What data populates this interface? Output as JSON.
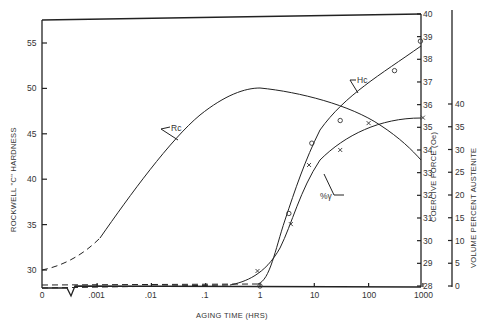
{
  "chart_data": {
    "type": "line",
    "title": "",
    "xlabel": "AGING TIME (HRS)",
    "x_scale": "log (with 0 at origin, broken axis)",
    "x_ticks": [
      "0",
      ".001",
      ".01",
      ".1",
      "1",
      "10",
      "100",
      "1000"
    ],
    "y_axes": [
      {
        "label": "ROCKWELL \"C\" HARDNESS",
        "position": "left",
        "ticks": [
          "30",
          "35",
          "40",
          "45",
          "50",
          "55"
        ],
        "range": [
          28,
          57.5
        ]
      },
      {
        "label": "COERCIVE FORCE (Oe)",
        "position": "right-inner",
        "ticks": [
          "28",
          "29",
          "30",
          "31",
          "32",
          "33",
          "34",
          "35",
          "36",
          "37",
          "38",
          "39",
          "40"
        ],
        "range": [
          28,
          40
        ]
      },
      {
        "label": "VOLUME PERCENT AUSTENITE",
        "position": "right-outer",
        "ticks": [
          "0",
          "5",
          "10",
          "15",
          "20",
          "25",
          "30",
          "35",
          "40"
        ],
        "range": [
          0,
          40
        ]
      }
    ],
    "series": [
      {
        "name": "Rc",
        "axis": "left",
        "x": [
          0,
          0.001,
          0.01,
          0.1,
          1,
          10,
          100,
          1000
        ],
        "values": [
          30,
          33.5,
          43,
          48.3,
          50,
          48.5,
          46,
          42
        ],
        "note": "dashed from 0 to .001"
      },
      {
        "name": "Hc",
        "axis": "coercive",
        "x": [
          0,
          1,
          3,
          10,
          30,
          100,
          300,
          1000
        ],
        "values": [
          28,
          28,
          32,
          35.6,
          36.8,
          37.6,
          38.2,
          38.6
        ],
        "markers": "circle",
        "points": [
          {
            "x": 1,
            "y": 28
          },
          {
            "x": 3.4,
            "y": 31.2
          },
          {
            "x": 9,
            "y": 34.3
          },
          {
            "x": 30,
            "y": 35.3
          },
          {
            "x": 300,
            "y": 37.5
          },
          {
            "x": 900,
            "y": 38.8
          }
        ]
      },
      {
        "name": "%γ",
        "axis": "austenite",
        "x": [
          0,
          0.1,
          1,
          3,
          10,
          30,
          100,
          300,
          1000
        ],
        "values": [
          0,
          0.5,
          3,
          13,
          26,
          32,
          35,
          36,
          37
        ],
        "markers": "cross",
        "points": [
          {
            "x": 0.9,
            "y": 3.3
          },
          {
            "x": 3.7,
            "y": 13.6
          },
          {
            "x": 8,
            "y": 26.6
          },
          {
            "x": 30,
            "y": 29.9
          },
          {
            "x": 100,
            "y": 35.8
          },
          {
            "x": 1000,
            "y": 37
          }
        ]
      }
    ],
    "annotations": [
      "Rc",
      "Hc",
      "%γ"
    ],
    "grid": false,
    "legend": "none (curves labeled inline)"
  },
  "labels": {
    "xlabel": "AGING TIME (HRS)",
    "left_axis": "ROCKWELL \"C\" HARDNESS",
    "coercive_axis": "COERCIVE FORCE (Oe)",
    "austenite_axis": "VOLUME PERCENT AUSTENITE",
    "rc": "Rc",
    "hc": "Hc",
    "gamma": "%γ"
  }
}
